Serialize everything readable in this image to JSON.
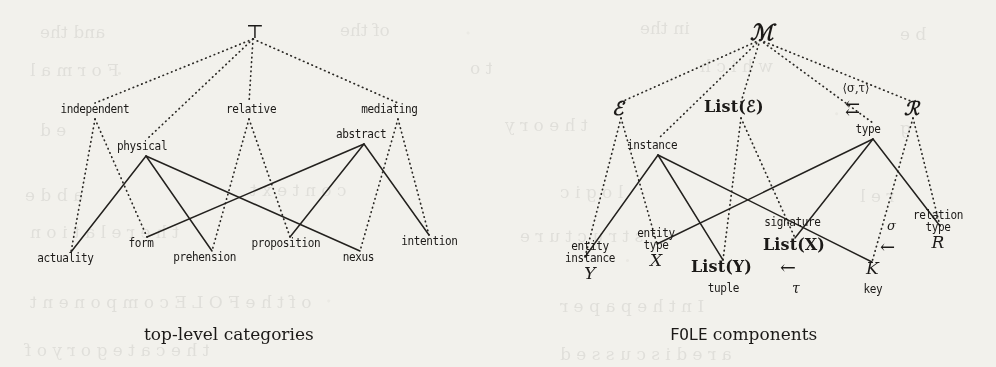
{
  "figure": {
    "kind": "two side-by-side lattice (Hasse) diagrams from a scanned paper",
    "background_color": "#f2f1ec",
    "ink_color": "#1c1a18"
  },
  "left_diagram": {
    "caption": "top-level categories",
    "top_node": "⊤",
    "nodes": [
      {
        "id": "top",
        "label": "⊤",
        "x": 253,
        "y": 31,
        "style": "glyph"
      },
      {
        "id": "independent",
        "label": "independent",
        "x": 95,
        "y": 111,
        "style": "lab"
      },
      {
        "id": "relative",
        "label": "relative",
        "x": 249,
        "y": 111,
        "style": "lab"
      },
      {
        "id": "mediating",
        "label": "mediating",
        "x": 398,
        "y": 111,
        "style": "lab"
      },
      {
        "id": "physical",
        "label": "physical",
        "x": 146,
        "y": 148,
        "style": "lab"
      },
      {
        "id": "abstract",
        "label": "abstract",
        "x": 364,
        "y": 136,
        "style": "lab"
      },
      {
        "id": "actuality",
        "label": "actuality",
        "x": 71,
        "y": 260,
        "style": "lab"
      },
      {
        "id": "form",
        "label": "form",
        "x": 147,
        "y": 245,
        "style": "lab"
      },
      {
        "id": "prehension",
        "label": "prehension",
        "x": 212,
        "y": 259,
        "style": "lab"
      },
      {
        "id": "proposition",
        "label": "proposition",
        "x": 290,
        "y": 245,
        "style": "lab"
      },
      {
        "id": "nexus",
        "label": "nexus",
        "x": 360,
        "y": 259,
        "style": "lab"
      },
      {
        "id": "intention",
        "label": "intention",
        "x": 429,
        "y": 243,
        "style": "lab"
      }
    ],
    "dotted_edges": [
      [
        "top",
        "independent"
      ],
      [
        "top",
        "relative"
      ],
      [
        "top",
        "mediating"
      ],
      [
        "top",
        "physical"
      ],
      [
        "independent",
        "actuality"
      ],
      [
        "independent",
        "form"
      ],
      [
        "relative",
        "prehension"
      ],
      [
        "relative",
        "proposition"
      ],
      [
        "mediating",
        "nexus"
      ],
      [
        "mediating",
        "intention"
      ]
    ],
    "solid_edges": [
      [
        "physical",
        "actuality"
      ],
      [
        "physical",
        "prehension"
      ],
      [
        "physical",
        "nexus"
      ],
      [
        "abstract",
        "form"
      ],
      [
        "abstract",
        "proposition"
      ],
      [
        "abstract",
        "intention"
      ]
    ]
  },
  "right_diagram": {
    "caption_mono": "FOLE",
    "caption_rest": " components",
    "edge_label": "⟨σ,τ⟩",
    "nodes": [
      {
        "id": "M",
        "label": "ℳ",
        "x": 760,
        "y": 32,
        "style": "script"
      },
      {
        "id": "E",
        "label": "ℰ",
        "x": 621,
        "y": 110,
        "style": "script"
      },
      {
        "id": "ListE",
        "label": "List(ℰ)",
        "x": 741,
        "y": 110,
        "style": "mathb"
      },
      {
        "id": "arrows",
        "label": "⇇",
        "x": 855,
        "y": 110,
        "style": "glyph"
      },
      {
        "id": "R",
        "label": "ℛ",
        "x": 913,
        "y": 110,
        "style": "script"
      },
      {
        "id": "instance",
        "label": "instance",
        "x": 658,
        "y": 147,
        "style": "lab"
      },
      {
        "id": "type",
        "label": "type",
        "x": 873,
        "y": 131,
        "style": "lab"
      },
      {
        "id": "signature",
        "label": "signature",
        "x": 795,
        "y": 224,
        "style": "lab"
      },
      {
        "id": "relType",
        "label": "relation\ntype\nR",
        "x": 940,
        "y": 234,
        "style": "stack"
      },
      {
        "id": "entInst",
        "label": "entity\ninstance\nY",
        "x": 585,
        "y": 265,
        "style": "stack"
      },
      {
        "id": "entType",
        "label": "entity\ntype\nX",
        "x": 657,
        "y": 252,
        "style": "stack"
      },
      {
        "id": "ListY",
        "label": "List(Y)",
        "x": 723,
        "y": 268,
        "style": "mathb"
      },
      {
        "id": "tuple",
        "label": "tuple",
        "x": 727,
        "y": 289,
        "style": "lab"
      },
      {
        "id": "ListX",
        "label": "List(X)",
        "x": 795,
        "y": 246,
        "style": "mathb"
      },
      {
        "id": "tauArrow",
        "label": "←",
        "x": 795,
        "y": 268,
        "style": "glyph"
      },
      {
        "id": "tau",
        "label": "τ",
        "x": 797,
        "y": 289,
        "style": "mathi"
      },
      {
        "id": "sigmaArrow",
        "label": "←",
        "x": 895,
        "y": 247,
        "style": "glyph"
      },
      {
        "id": "sigma",
        "label": "σ",
        "x": 892,
        "y": 229,
        "style": "mathi"
      },
      {
        "id": "K",
        "label": "K",
        "x": 872,
        "y": 270,
        "style": "mathi"
      },
      {
        "id": "key",
        "label": "key",
        "x": 873,
        "y": 290,
        "style": "lab"
      }
    ],
    "dotted_edges": [
      [
        "M",
        "E"
      ],
      [
        "M",
        "ListE"
      ],
      [
        "M",
        "R"
      ],
      [
        "M",
        "instance"
      ],
      [
        "M",
        "type"
      ],
      [
        "E",
        "entInst"
      ],
      [
        "E",
        "entType"
      ],
      [
        "ListE",
        "ListY"
      ],
      [
        "ListE",
        "ListX"
      ],
      [
        "R",
        "K"
      ],
      [
        "R",
        "relType"
      ]
    ],
    "solid_edges": [
      [
        "instance",
        "entInst"
      ],
      [
        "instance",
        "ListY"
      ],
      [
        "instance",
        "K"
      ],
      [
        "type",
        "entType"
      ],
      [
        "type",
        "ListX"
      ],
      [
        "type",
        "relType"
      ]
    ]
  },
  "scan_bleed_through": {
    "note": "faint mirrored text bleeding through from the reverse page",
    "lines": [
      {
        "text": "and the",
        "x": 40,
        "y": 22
      },
      {
        "text": "of the",
        "x": 340,
        "y": 20
      },
      {
        "text": "in the",
        "x": 640,
        "y": 18
      },
      {
        "text": "b e",
        "x": 900,
        "y": 24
      },
      {
        "text": "F o r m a l",
        "x": 30,
        "y": 60
      },
      {
        "text": "t o",
        "x": 470,
        "y": 58
      },
      {
        "text": "w h i c h",
        "x": 700,
        "y": 56
      },
      {
        "text": "e d",
        "x": 40,
        "y": 120
      },
      {
        "text": "t h e o r y",
        "x": 505,
        "y": 115
      },
      {
        "text": "g",
        "x": 900,
        "y": 118
      },
      {
        "text": "a b d e",
        "x": 25,
        "y": 185
      },
      {
        "text": "c o n t e x t",
        "x": 250,
        "y": 180
      },
      {
        "text": "l o g i c",
        "x": 560,
        "y": 182
      },
      {
        "text": "r e l",
        "x": 860,
        "y": 186
      },
      {
        "text": "t h e   r e l a t i o n",
        "x": 30,
        "y": 222
      },
      {
        "text": "s t r u c t u r e",
        "x": 520,
        "y": 226
      },
      {
        "text": "o f   t h e   F O L E   c o m p o n e n t",
        "x": 30,
        "y": 292
      },
      {
        "text": "I n   t h e   p a p e r",
        "x": 560,
        "y": 296
      },
      {
        "text": "t h e   c a t e g o r y   o f",
        "x": 25,
        "y": 340
      },
      {
        "text": "a r e   d i s c u s s e d",
        "x": 560,
        "y": 344
      }
    ]
  }
}
